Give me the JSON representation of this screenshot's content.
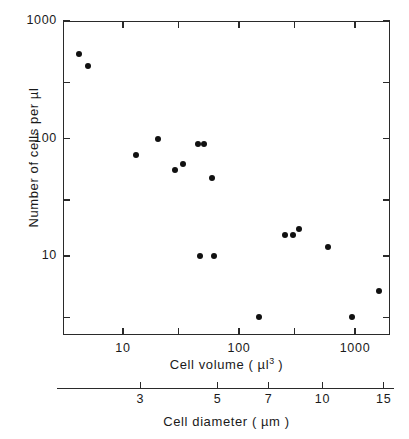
{
  "chart_data": {
    "type": "scatter",
    "title": "",
    "xlabel": "Cell volume ( µl3 )",
    "xlabel_text": "Cell volume ( µl",
    "xlabel_sup": "3",
    "xlabel_tail": " )",
    "ylabel": "Number of cells per µl",
    "xscale": "log",
    "yscale": "log",
    "xlim": [
      3.2,
      2200
    ],
    "ylim": [
      2.0,
      1000
    ],
    "grid": false,
    "legend": null,
    "x_ticklabels": [
      "10",
      "100",
      "1000"
    ],
    "x_tickvalues": [
      10,
      100,
      1000
    ],
    "y_ticklabels": [
      "1000",
      "100",
      "10"
    ],
    "y_tickvalues": [
      1000,
      100,
      10
    ],
    "secondary_axis": {
      "label": "Cell diameter ( µm )",
      "label_text": "Cell diameter ( µm )",
      "ticklabels": [
        "3",
        "5",
        "7",
        "10",
        "15"
      ],
      "tickvalues": [
        3,
        5,
        7,
        10,
        15
      ],
      "relation": "volume = (pi/6) * diameter^3"
    },
    "points": [
      {
        "x": 4.2,
        "y": 520
      },
      {
        "x": 5.0,
        "y": 410
      },
      {
        "x": 13,
        "y": 72
      },
      {
        "x": 20,
        "y": 100
      },
      {
        "x": 28,
        "y": 54
      },
      {
        "x": 33,
        "y": 61
      },
      {
        "x": 44,
        "y": 90
      },
      {
        "x": 50,
        "y": 90
      },
      {
        "x": 46,
        "y": 10
      },
      {
        "x": 59,
        "y": 46
      },
      {
        "x": 61,
        "y": 10
      },
      {
        "x": 150,
        "y": 3.0
      },
      {
        "x": 250,
        "y": 15
      },
      {
        "x": 295,
        "y": 15
      },
      {
        "x": 330,
        "y": 17
      },
      {
        "x": 580,
        "y": 12
      },
      {
        "x": 950,
        "y": 3.0
      },
      {
        "x": 1600,
        "y": 5.0
      }
    ],
    "marker": {
      "shape": "circle",
      "color": "#111111",
      "size_px": 6
    },
    "axis_color": "#2a2a2a",
    "background": "#ffffff"
  }
}
